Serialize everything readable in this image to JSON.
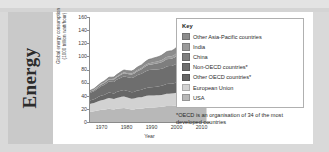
{
  "section": {
    "title": "Energy"
  },
  "legend": {
    "title": "Key",
    "items": [
      {
        "label": "Other Asia-Pacific countries",
        "color": "#8c8c8c"
      },
      {
        "label": "India",
        "color": "#9a9a9a"
      },
      {
        "label": "China",
        "color": "#7e7e7e"
      },
      {
        "label": "Non-OECD countries*",
        "color": "#6e6e6e"
      },
      {
        "label": "Other OECD countries*",
        "color": "#666666"
      },
      {
        "label": "European Union",
        "color": "#d2d2d2"
      },
      {
        "label": "USA",
        "color": "#b8b8b8"
      }
    ],
    "footnote": "*OECD is an organisation of 34 of the most developed countries"
  },
  "chart_data": {
    "type": "area",
    "stacked": true,
    "title": "",
    "xlabel": "Year",
    "ylabel": "Global energy consumption (1000 trillion watt/hour)",
    "ylabel_line1": "Global energy consumption",
    "ylabel_line2": "(1000 trillion watt/hour)",
    "xlim": [
      1965,
      2013
    ],
    "ylim": [
      0,
      160
    ],
    "yticks": [
      0,
      20,
      40,
      60,
      80,
      100,
      120,
      140,
      160
    ],
    "xticks": [
      1970,
      1980,
      1990,
      2000,
      2010
    ],
    "grid": false,
    "legend_position": "right",
    "x": [
      1965,
      1966,
      1967,
      1968,
      1969,
      1970,
      1971,
      1972,
      1973,
      1974,
      1975,
      1976,
      1977,
      1978,
      1979,
      1980,
      1981,
      1982,
      1983,
      1984,
      1985,
      1986,
      1987,
      1988,
      1989,
      1990,
      1991,
      1992,
      1993,
      1994,
      1995,
      1996,
      1997,
      1998,
      1999,
      2000,
      2001,
      2002,
      2003,
      2004,
      2005,
      2006,
      2007,
      2008,
      2009,
      2010,
      2011,
      2012
    ],
    "series": [
      {
        "name": "USA",
        "color": "#b8b8b8",
        "values": [
          15.2,
          15.8,
          16.3,
          17.2,
          18.0,
          18.5,
          18.8,
          19.6,
          20.2,
          19.6,
          19.1,
          20.1,
          20.6,
          21.0,
          21.2,
          20.4,
          20.0,
          19.2,
          19.2,
          20.1,
          20.2,
          20.3,
          21.0,
          21.8,
          22.2,
          22.2,
          22.1,
          22.5,
          22.9,
          23.2,
          23.5,
          24.2,
          24.3,
          24.3,
          24.6,
          25.2,
          24.4,
          24.7,
          24.8,
          25.3,
          25.4,
          25.2,
          25.6,
          25.0,
          23.4,
          24.1,
          23.8,
          23.3
        ]
      },
      {
        "name": "European Union",
        "color": "#d2d2d2",
        "values": [
          11.8,
          12.3,
          12.6,
          13.3,
          14.1,
          14.8,
          15.1,
          15.7,
          16.4,
          16.2,
          15.8,
          16.6,
          16.8,
          17.3,
          17.7,
          17.2,
          16.7,
          16.4,
          16.6,
          16.9,
          17.4,
          17.6,
          18.0,
          18.1,
          18.1,
          18.0,
          18.4,
          18.1,
          18.0,
          18.0,
          18.4,
          19.0,
          18.9,
          19.1,
          19.2,
          19.4,
          19.7,
          19.6,
          20.0,
          20.1,
          20.1,
          20.2,
          19.8,
          19.7,
          18.6,
          19.3,
          18.5,
          18.4
        ]
      },
      {
        "name": "Other OECD countries*",
        "color": "#666666",
        "values": [
          5.2,
          5.5,
          5.8,
          6.2,
          6.6,
          7.1,
          7.4,
          7.9,
          8.4,
          8.4,
          8.5,
          9.0,
          9.3,
          9.6,
          10.0,
          10.0,
          10.0,
          9.9,
          10.1,
          10.6,
          10.9,
          11.1,
          11.5,
          12.0,
          12.4,
          12.7,
          13.0,
          13.3,
          13.5,
          13.9,
          14.3,
          14.7,
          14.9,
          14.8,
          15.2,
          15.6,
          15.7,
          16.0,
          16.3,
          16.7,
          16.9,
          17.0,
          17.3,
          17.2,
          16.6,
          17.2,
          17.0,
          17.2
        ]
      },
      {
        "name": "Non-OECD countries*",
        "color": "#6e6e6e",
        "values": [
          11.0,
          11.6,
          12.1,
          12.9,
          13.6,
          14.4,
          15.1,
          15.8,
          16.6,
          17.2,
          17.7,
          18.5,
          19.2,
          20.0,
          20.7,
          21.0,
          21.3,
          21.7,
          22.3,
          23.1,
          23.8,
          24.5,
          25.3,
          26.0,
          26.5,
          26.6,
          26.4,
          26.2,
          26.0,
          25.9,
          26.2,
          26.8,
          27.1,
          27.2,
          27.7,
          28.4,
          28.9,
          29.6,
          30.7,
          32.0,
          33.1,
          34.1,
          35.2,
          36.0,
          35.8,
          37.4,
          38.4,
          39.2
        ]
      },
      {
        "name": "China",
        "color": "#7e7e7e",
        "values": [
          1.8,
          1.9,
          1.7,
          1.9,
          2.2,
          2.5,
          2.7,
          2.9,
          3.1,
          3.2,
          3.6,
          3.8,
          4.2,
          4.6,
          4.8,
          4.8,
          4.8,
          5.1,
          5.4,
          5.9,
          6.3,
          6.7,
          7.2,
          7.7,
          8.0,
          8.2,
          8.6,
          9.0,
          9.5,
          10.0,
          10.6,
          10.8,
          10.8,
          10.9,
          11.2,
          11.9,
          12.6,
          13.7,
          15.8,
          17.8,
          19.9,
          22.0,
          24.2,
          25.4,
          26.7,
          29.3,
          32.0,
          33.4
        ]
      },
      {
        "name": "India",
        "color": "#9a9a9a",
        "values": [
          0.6,
          0.6,
          0.7,
          0.7,
          0.8,
          0.8,
          0.9,
          0.9,
          1.0,
          1.0,
          1.1,
          1.1,
          1.2,
          1.3,
          1.3,
          1.4,
          1.5,
          1.6,
          1.7,
          1.8,
          1.9,
          2.0,
          2.2,
          2.3,
          2.5,
          2.6,
          2.8,
          2.9,
          3.0,
          3.2,
          3.4,
          3.6,
          3.7,
          3.9,
          4.0,
          4.2,
          4.4,
          4.6,
          4.8,
          5.1,
          5.4,
          5.7,
          6.1,
          6.4,
          6.9,
          7.3,
          7.7,
          8.1
        ]
      },
      {
        "name": "Other Asia-Pacific countries",
        "color": "#8c8c8c",
        "values": [
          1.4,
          1.5,
          1.6,
          1.8,
          1.9,
          2.1,
          2.2,
          2.4,
          2.6,
          2.7,
          2.8,
          3.0,
          3.2,
          3.4,
          3.6,
          3.7,
          3.8,
          3.9,
          4.1,
          4.4,
          4.6,
          4.8,
          5.1,
          5.5,
          5.8,
          6.1,
          6.4,
          6.7,
          7.0,
          7.4,
          7.8,
          8.1,
          8.4,
          8.3,
          8.7,
          9.1,
          9.3,
          9.7,
          10.0,
          10.4,
          10.8,
          11.2,
          11.6,
          11.9,
          12.0,
          12.6,
          13.0,
          13.4
        ]
      }
    ]
  }
}
